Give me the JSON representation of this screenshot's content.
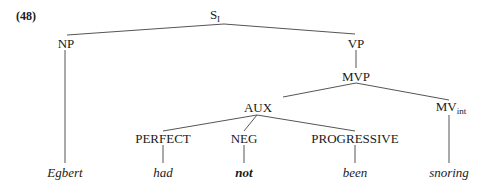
{
  "example_number": "(48)",
  "tree": {
    "root": {
      "label": "S",
      "subscript": "I"
    },
    "np": {
      "label": "NP"
    },
    "vp": {
      "label": "VP"
    },
    "mvp": {
      "label": "MVP"
    },
    "aux": {
      "label": "AUX"
    },
    "mv": {
      "label": "MV",
      "subscript": "int"
    },
    "perfect": {
      "label": "PERFECT"
    },
    "neg": {
      "label": "NEG"
    },
    "progressive": {
      "label": "PROGRESSIVE"
    },
    "leaves": {
      "egbert": "Egbert",
      "had": "had",
      "not": "not",
      "been": "been",
      "snoring": "snoring"
    }
  }
}
